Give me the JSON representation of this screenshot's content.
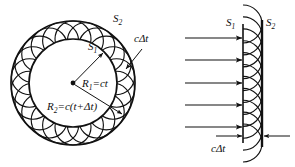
{
  "figure": {
    "background": "#ffffff",
    "ink": "#111111",
    "width": 295,
    "height": 167
  },
  "left_panel": {
    "name": "spherical-wavefront-construction",
    "center_label": "source-point",
    "inner_wavefront_label": "S",
    "inner_wavefront_sub": "1",
    "outer_wavefront_label": "S",
    "outer_wavefront_sub": "2",
    "gap_label_c": "c",
    "gap_label_delta": "Δt",
    "radius1": {
      "lhs": "R",
      "sub": "1",
      "eq": "=ct"
    },
    "radius2": {
      "lhs": "R",
      "sub": "2",
      "eq": "=c(t+Δt)"
    },
    "geometry": {
      "center_x": 73,
      "center_y": 83,
      "r_inner": 44,
      "r_outer": 62,
      "wavelet_count": 22,
      "wavelet_radius": 18
    }
  },
  "right_panel": {
    "name": "plane-wavefront-construction",
    "incident_wave_label": "incident-plane-wave-rays",
    "wavefront1_label": "S",
    "wavefront1_sub": "1",
    "wavefront2_label": "S",
    "wavefront2_sub": "2",
    "gap_label_c": "c",
    "gap_label_delta": "Δt",
    "ray_count": 5,
    "wavelet_count": 11,
    "geometry": {
      "front1_x": 243,
      "front2_x": 262,
      "top_y": 24,
      "bottom_y": 143,
      "ray_start_x": 185,
      "ray_ys": [
        38,
        60,
        83,
        105,
        127
      ]
    }
  },
  "chart_data": {
    "type": "diagram",
    "left": {
      "inner_radius_expression": "R1=ct",
      "outer_radius_expression": "R2=c(t+Δt)",
      "wavelet_radius_expression": "cΔt"
    },
    "right": {
      "separation_expression": "cΔt",
      "fronts": [
        "S1",
        "S2"
      ]
    }
  }
}
